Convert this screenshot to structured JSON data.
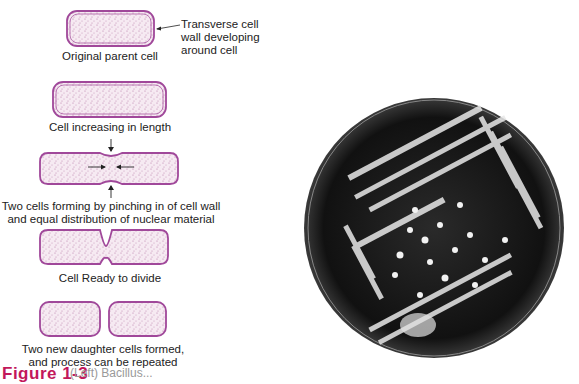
{
  "diagram": {
    "stages": [
      {
        "label": "Original parent cell"
      },
      {
        "label": "Cell increasing in length"
      },
      {
        "label": "Two cells forming by pinching in of cell wall",
        "label2": "and equal distribution of nuclear material"
      },
      {
        "label": "Cell Ready to divide"
      },
      {
        "label": "Two new daughter cells formed,",
        "label2": "and process can be repeated"
      }
    ],
    "annotation": {
      "line1": "Transverse cell",
      "line2": "wall developing",
      "line3": "around cell"
    },
    "colors": {
      "cell_wall": "#a0489a",
      "cell_fill": "#f3e4ef",
      "stipple": "#b87aa8"
    }
  },
  "photo": {
    "description": "Petri dish with streaked bacterial colonies"
  },
  "caption": {
    "figure": "Figure 1-3",
    "text": "(Left) Bacillus..."
  }
}
